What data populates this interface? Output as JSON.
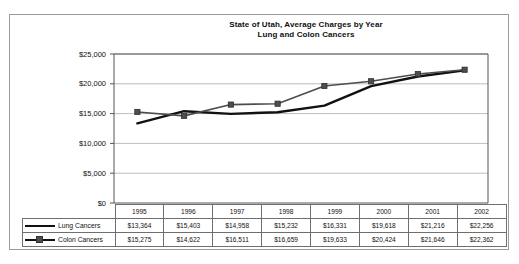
{
  "chart_data": {
    "type": "line",
    "title": "State of Utah, Average Charges by Year\nLung and Colon Cancers",
    "title_line1": "State of Utah, Average Charges by Year",
    "title_line2": "Lung and Colon Cancers",
    "xlabel": "",
    "ylabel": "",
    "grid": true,
    "legend_position": "table-left",
    "categories": [
      "1995",
      "1996",
      "1997",
      "1998",
      "1999",
      "2000",
      "2001",
      "2002"
    ],
    "ylim": [
      0,
      25000
    ],
    "ytick_values": [
      0,
      5000,
      10000,
      15000,
      20000,
      25000
    ],
    "ytick_labels": [
      "$0",
      "$5,000",
      "$10,000",
      "$15,000",
      "$20,000",
      "$25,000"
    ],
    "series": [
      {
        "name": "Lung Cancers",
        "color": "#111111",
        "marker": "none",
        "values": [
          13364,
          15403,
          14958,
          15232,
          16331,
          19618,
          21216,
          22256
        ],
        "labels": [
          "$13,364",
          "$15,403",
          "$14,958",
          "$15,232",
          "$16,331",
          "$19,618",
          "$21,216",
          "$22,256"
        ]
      },
      {
        "name": "Colon Cancers",
        "color": "#4d4d4d",
        "marker": "square",
        "values": [
          15275,
          14622,
          16511,
          16659,
          19633,
          20424,
          21646,
          22362
        ],
        "labels": [
          "$15,275",
          "$14,622",
          "$16,511",
          "$16,659",
          "$19,633",
          "$20,424",
          "$21,646",
          "$22,362"
        ]
      }
    ]
  },
  "table": {
    "header_row_label": "",
    "years": [
      "1995",
      "1996",
      "1997",
      "1998",
      "1999",
      "2000",
      "2001",
      "2002"
    ],
    "rows": [
      {
        "label": "Lung Cancers",
        "marker": "line",
        "values": [
          "$13,364",
          "$15,403",
          "$14,958",
          "$15,232",
          "$16,331",
          "$19,618",
          "$21,216",
          "$22,256"
        ]
      },
      {
        "label": "Colon Cancers",
        "marker": "line-square",
        "values": [
          "$15,275",
          "$14,622",
          "$16,511",
          "$16,659",
          "$19,633",
          "$20,424",
          "$21,646",
          "$22,362"
        ]
      }
    ]
  },
  "colors": {
    "lung_line": "#111111",
    "colon_line": "#4d4d4d",
    "gridline": "#bdbdbd",
    "axis": "#555555",
    "frame_border": "#9a9a9a",
    "table_border": "#6f6f6f"
  }
}
